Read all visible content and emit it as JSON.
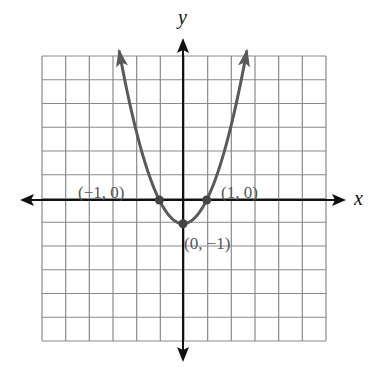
{
  "chart_data": {
    "type": "line",
    "title": "",
    "xlabel": "x",
    "ylabel": "y",
    "function": "y = x^2 - 1",
    "xlim": [
      -6,
      6
    ],
    "ylim": [
      -6,
      6
    ],
    "grid": true,
    "grid_cells": 12,
    "series": [
      {
        "name": "parabola",
        "x": [
          -2.7,
          -2,
          -1,
          0,
          1,
          2,
          2.7
        ],
        "y": [
          6.29,
          3,
          0,
          -1,
          0,
          3,
          6.29
        ]
      }
    ],
    "points": [
      {
        "x": -1,
        "y": 0,
        "label": "(−1, 0)"
      },
      {
        "x": 1,
        "y": 0,
        "label": "(1, 0)"
      },
      {
        "x": 0,
        "y": -1,
        "label": "(0, −1)"
      }
    ]
  },
  "labels": {
    "x_axis": "x",
    "y_axis": "y",
    "pt_left": "(−1, 0)",
    "pt_right": "(1, 0)",
    "pt_vertex": "(0, −1)"
  },
  "colors": {
    "grid": "#8a8a8a",
    "axis": "#111111",
    "curve": "#5a5a5a",
    "label": "#555555"
  }
}
